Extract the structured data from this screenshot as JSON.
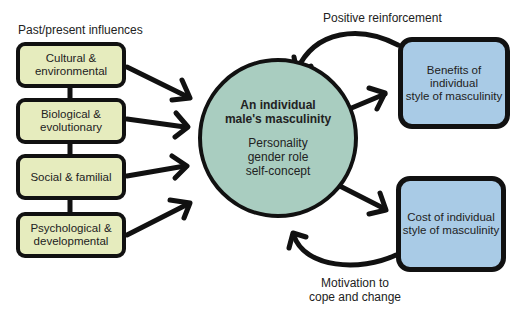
{
  "diagram": {
    "influences_heading": "Past/present influences",
    "influences": [
      {
        "line1": "Cultural &",
        "line2": "environmental"
      },
      {
        "line1": "Biological &",
        "line2": "evolutionary"
      },
      {
        "line1": "Social & familial",
        "line2": ""
      },
      {
        "line1": "Psychological &",
        "line2": "developmental"
      }
    ],
    "center": {
      "title_line1": "An individual",
      "title_line2": "male's masculinity",
      "attributes": [
        "Personality",
        "gender role",
        "self-concept"
      ]
    },
    "benefits_box": {
      "line1": "Benefits of individual",
      "line2": "style of masculinity"
    },
    "cost_box": {
      "line1": "Cost of individual",
      "line2": "style of masculinity"
    },
    "feedback_top": "Positive reinforcement",
    "feedback_bottom": {
      "line1": "Motivation to",
      "line2": "cope and change"
    },
    "colors": {
      "influence_fill": "#e6ecbe",
      "center_fill": "#a9cdc0",
      "outcome_fill": "#a9cbe6",
      "stroke": "#111111"
    }
  }
}
